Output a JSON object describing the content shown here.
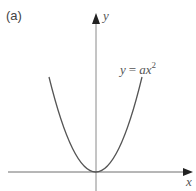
{
  "figure": {
    "panel_label": "(a)",
    "x_axis_label": "x",
    "y_axis_label": "y",
    "curve_label": {
      "lhs": "y",
      "eq": "=",
      "rhs": "ax",
      "exponent": "2"
    },
    "colors": {
      "axis": "#6e6e6e",
      "curve": "#555555",
      "text": "#555555"
    }
  }
}
